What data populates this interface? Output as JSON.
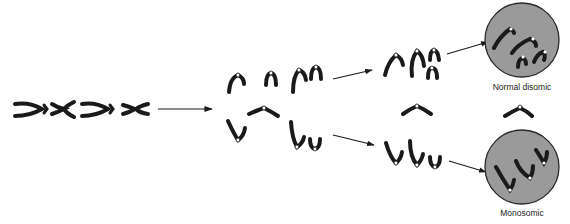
{
  "diagram": {
    "type": "chromosome nondisjunction",
    "stages": [
      {
        "id": "parent",
        "description": "Four chromosomes (X-shaped) in a row"
      },
      {
        "id": "separation",
        "description": "Chromatids separate; one lagging chromosome"
      },
      {
        "id": "daughter_groups",
        "description": "Upper group of four, lagging chromatid, lower group of three"
      },
      {
        "id": "daughter_cells",
        "description": "Resulting cells"
      }
    ],
    "labels": {
      "top_cell": "Normal disomic",
      "bottom_cell": "Monosomic"
    },
    "colors": {
      "chromosome": "#1a1a1a",
      "cell_fill": "#9a9a9a",
      "cell_stroke": "#2a2a2a",
      "arrow": "#1a1a1a",
      "background": "#ffffff"
    }
  }
}
